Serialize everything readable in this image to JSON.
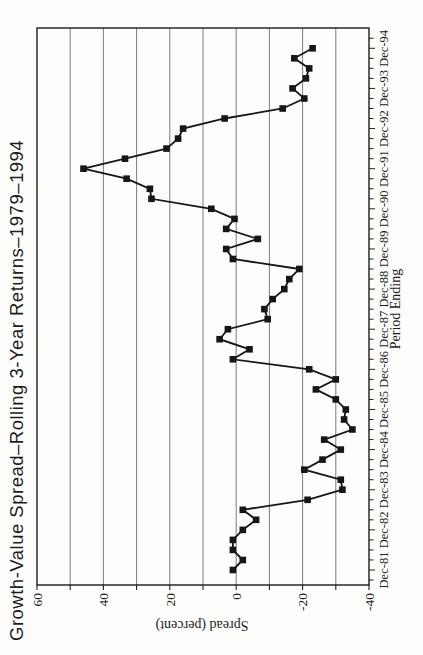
{
  "chart_data": {
    "type": "line",
    "title": "Growth-Value Spread–Rolling 3-Year Returns–1979–1994",
    "xlabel": "Period Ending",
    "ylabel": "Spread (percent)",
    "orientation": "rotated-90deg-ccw-on-page",
    "grid": "value-axis gridlines every 10",
    "ylim": [
      -40,
      60
    ],
    "ytick_interval": 10,
    "ytick_labels": [
      "60",
      "40",
      "20",
      "0",
      "-20",
      "-40"
    ],
    "ytick_label_values": [
      60,
      40,
      20,
      0,
      -20,
      -40
    ],
    "xtick_labels": [
      "Dec-81",
      "Dec-82",
      "Dec-83",
      "Dec-84",
      "Dec-85",
      "Dec-86",
      "Dec-87",
      "Dec-88",
      "Dec-89",
      "Dec-90",
      "Dec-91",
      "Dec-92",
      "Dec-93",
      "Dec-94"
    ],
    "x_frequency": "quarterly",
    "x_start_label": "Dec-81",
    "x_end_label": "Dec-94",
    "points_per_year": 4,
    "series": [
      {
        "name": "spread",
        "marker": "square",
        "color": "#161616",
        "values": [
          1,
          -2,
          1,
          1,
          -2,
          -6,
          -2,
          -21.5,
          -32,
          -31.5,
          -20.5,
          -26,
          -31.5,
          -26.5,
          -35,
          -32.5,
          -33,
          -30,
          -24,
          -30,
          -22,
          1,
          -4,
          5,
          2.5,
          -9.5,
          -8.5,
          -11,
          -14.5,
          -16,
          -19,
          1,
          3,
          -6.5,
          3,
          0.5,
          7.5,
          25.5,
          26,
          33,
          46,
          33.5,
          21,
          17.5,
          16,
          3.5,
          -14,
          -20.5,
          -17,
          -21,
          -22,
          -17.5,
          -23
        ]
      }
    ]
  }
}
